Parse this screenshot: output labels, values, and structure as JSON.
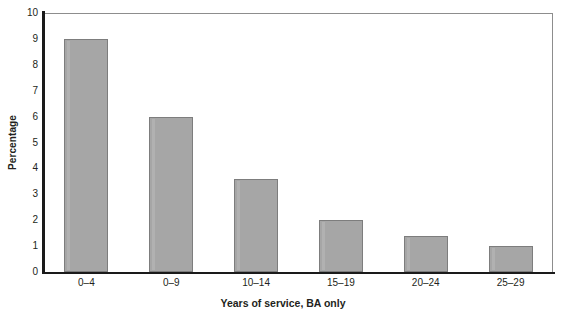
{
  "chart_data": {
    "type": "bar",
    "title": "",
    "categories": [
      "0–4",
      "0–9",
      "10–14",
      "15–19",
      "20–24",
      "25–29"
    ],
    "values": [
      9.0,
      6.0,
      3.6,
      2.0,
      1.4,
      1.0
    ],
    "xlabel": "Years of service, BA only",
    "ylabel": "Percentage",
    "ylim": [
      0,
      10
    ],
    "ytick_labels": [
      "0",
      "1",
      "2",
      "3",
      "4",
      "5",
      "6",
      "7",
      "8",
      "9",
      "10"
    ],
    "ytick_values": [
      0,
      1,
      2,
      3,
      4,
      5,
      6,
      7,
      8,
      9,
      10
    ],
    "grid": false,
    "legend": "none",
    "bar_color": "#a6a6a6",
    "bar_border_color": "#7d7d7d",
    "axis_color": "#1a1a1a",
    "text_color": "#231f20"
  }
}
